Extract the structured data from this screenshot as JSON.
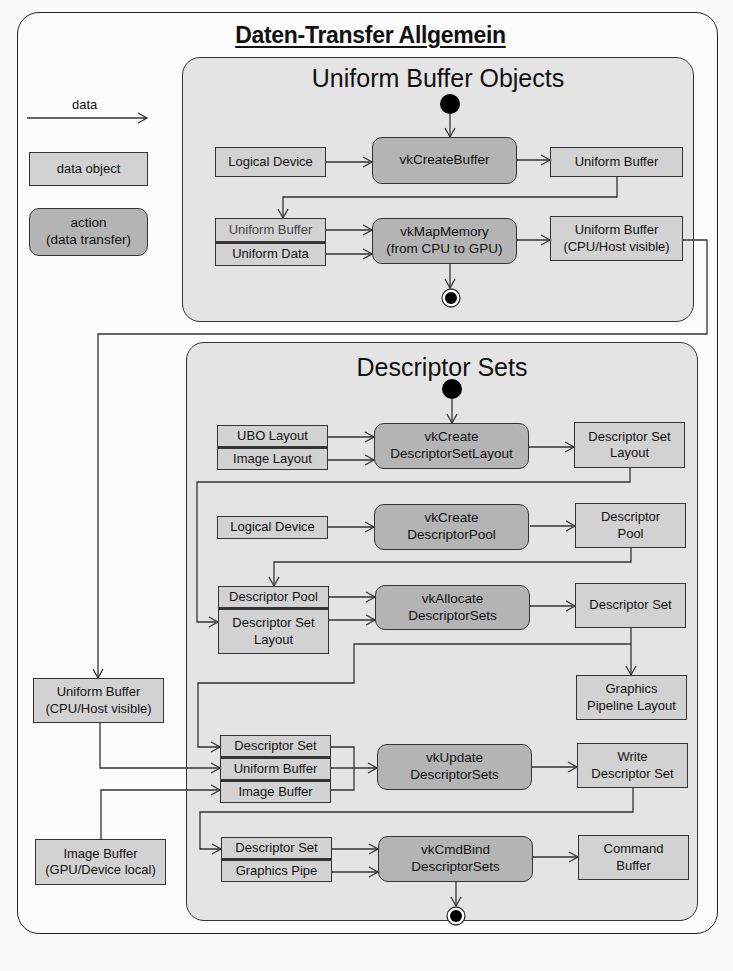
{
  "title": "Daten-Transfer Allgemein",
  "legend": {
    "arrow_label": "data",
    "data_object": "data object",
    "action_line1": "action",
    "action_line2": "(data transfer)"
  },
  "external": {
    "uniform_buffer_l1": "Uniform Buffer",
    "uniform_buffer_l2": "(CPU/Host visible)",
    "image_buffer_l1": "Image Buffer",
    "image_buffer_l2": "(GPU/Device local)"
  },
  "ubo": {
    "title": "Uniform Buffer Objects",
    "logical_device": "Logical Device",
    "create_buffer": "vkCreateBuffer",
    "uniform_buffer_out": "Uniform Buffer",
    "uniform_buffer_in": "Uniform Buffer",
    "uniform_data": "Uniform Data",
    "map_memory_l1": "vkMapMemory",
    "map_memory_l2": "(from CPU to GPU)",
    "ub_visible_l1": "Uniform Buffer",
    "ub_visible_l2": "(CPU/Host visible)"
  },
  "ds": {
    "title": "Descriptor Sets",
    "ubo_layout": "UBO Layout",
    "image_layout": "Image Layout",
    "create_layout_l1": "vkCreate",
    "create_layout_l2": "DescriptorSetLayout",
    "dsl_out_l1": "Descriptor Set",
    "dsl_out_l2": "Layout",
    "logical_device": "Logical Device",
    "create_pool_l1": "vkCreate",
    "create_pool_l2": "DescriptorPool",
    "pool_out_l1": "Descriptor",
    "pool_out_l2": "Pool",
    "pool_in": "Descriptor Pool",
    "dsl_in_l1": "Descriptor Set",
    "dsl_in_l2": "Layout",
    "allocate_l1": "vkAllocate",
    "allocate_l2": "DescriptorSets",
    "set_out": "Descriptor Set",
    "gpl_l1": "Graphics",
    "gpl_l2": "Pipeline Layout",
    "upd_set": "Descriptor Set",
    "upd_ub": "Uniform Buffer",
    "upd_img": "Image Buffer",
    "update_l1": "vkUpdate",
    "update_l2": "DescriptorSets",
    "write_l1": "Write",
    "write_l2": "Descriptor Set",
    "bind_set": "Descriptor Set",
    "bind_pipe": "Graphics Pipe",
    "bind_l1": "vkCmdBind",
    "bind_l2": "DescriptorSets",
    "cmd_l1": "Command",
    "cmd_l2": "Buffer"
  },
  "colors": {
    "panel": "#e4e4e4",
    "data_object": "#d2d2d2",
    "action": "#b4b4b4",
    "line": "#333333"
  }
}
